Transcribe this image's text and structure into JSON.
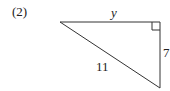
{
  "problem": {
    "label": "(2)"
  },
  "triangle": {
    "type": "right-triangle",
    "vertices": {
      "top_left": [
        60,
        22
      ],
      "right_angle": [
        160,
        22
      ],
      "bottom": [
        160,
        88
      ]
    },
    "sides": {
      "top": {
        "label": "y",
        "italic": true
      },
      "right": {
        "label": "7"
      },
      "hypotenuse": {
        "label": "11"
      }
    },
    "right_angle_marker": true,
    "stroke_color": "#333333"
  }
}
